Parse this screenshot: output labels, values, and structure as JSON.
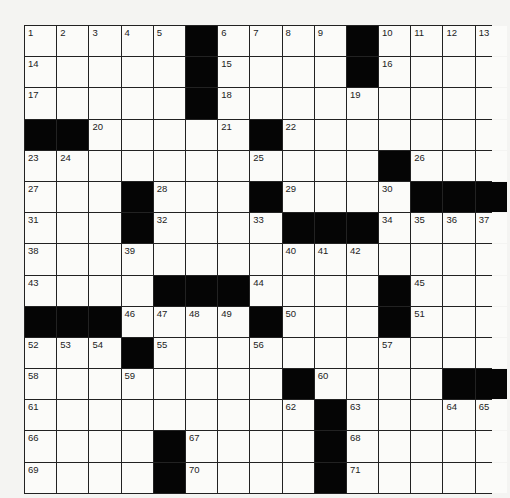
{
  "puzzle": {
    "rows": 15,
    "cols": 15,
    "colors": {
      "black": "#050505",
      "white": "#fbfbf9",
      "grid_line": "#222222"
    },
    "black_cells": [
      [
        0,
        5
      ],
      [
        0,
        10
      ],
      [
        1,
        5
      ],
      [
        1,
        10
      ],
      [
        2,
        5
      ],
      [
        3,
        0
      ],
      [
        3,
        1
      ],
      [
        3,
        7
      ],
      [
        4,
        11
      ],
      [
        5,
        3
      ],
      [
        5,
        7
      ],
      [
        5,
        12
      ],
      [
        5,
        13
      ],
      [
        5,
        14
      ],
      [
        6,
        3
      ],
      [
        6,
        8
      ],
      [
        6,
        9
      ],
      [
        6,
        10
      ],
      [
        8,
        4
      ],
      [
        8,
        5
      ],
      [
        8,
        6
      ],
      [
        8,
        11
      ],
      [
        9,
        0
      ],
      [
        9,
        1
      ],
      [
        9,
        2
      ],
      [
        9,
        7
      ],
      [
        9,
        11
      ],
      [
        10,
        3
      ],
      [
        11,
        8
      ],
      [
        11,
        13
      ],
      [
        11,
        14
      ],
      [
        12,
        9
      ],
      [
        13,
        4
      ],
      [
        13,
        9
      ],
      [
        14,
        4
      ],
      [
        14,
        9
      ]
    ],
    "numbers": [
      {
        "r": 0,
        "c": 0,
        "n": "1"
      },
      {
        "r": 0,
        "c": 1,
        "n": "2"
      },
      {
        "r": 0,
        "c": 2,
        "n": "3"
      },
      {
        "r": 0,
        "c": 3,
        "n": "4"
      },
      {
        "r": 0,
        "c": 4,
        "n": "5"
      },
      {
        "r": 0,
        "c": 6,
        "n": "6"
      },
      {
        "r": 0,
        "c": 7,
        "n": "7"
      },
      {
        "r": 0,
        "c": 8,
        "n": "8"
      },
      {
        "r": 0,
        "c": 9,
        "n": "9"
      },
      {
        "r": 0,
        "c": 11,
        "n": "10"
      },
      {
        "r": 0,
        "c": 12,
        "n": "11"
      },
      {
        "r": 0,
        "c": 13,
        "n": "12"
      },
      {
        "r": 0,
        "c": 14,
        "n": "13"
      },
      {
        "r": 1,
        "c": 0,
        "n": "14"
      },
      {
        "r": 1,
        "c": 6,
        "n": "15"
      },
      {
        "r": 1,
        "c": 11,
        "n": "16"
      },
      {
        "r": 2,
        "c": 0,
        "n": "17"
      },
      {
        "r": 2,
        "c": 6,
        "n": "18"
      },
      {
        "r": 2,
        "c": 10,
        "n": "19"
      },
      {
        "r": 3,
        "c": 2,
        "n": "20"
      },
      {
        "r": 3,
        "c": 6,
        "n": "21"
      },
      {
        "r": 3,
        "c": 8,
        "n": "22"
      },
      {
        "r": 4,
        "c": 0,
        "n": "23"
      },
      {
        "r": 4,
        "c": 1,
        "n": "24"
      },
      {
        "r": 4,
        "c": 7,
        "n": "25"
      },
      {
        "r": 4,
        "c": 12,
        "n": "26"
      },
      {
        "r": 5,
        "c": 0,
        "n": "27"
      },
      {
        "r": 5,
        "c": 4,
        "n": "28"
      },
      {
        "r": 5,
        "c": 8,
        "n": "29"
      },
      {
        "r": 5,
        "c": 11,
        "n": "30"
      },
      {
        "r": 6,
        "c": 0,
        "n": "31"
      },
      {
        "r": 6,
        "c": 4,
        "n": "32"
      },
      {
        "r": 6,
        "c": 7,
        "n": "33"
      },
      {
        "r": 6,
        "c": 11,
        "n": "34"
      },
      {
        "r": 6,
        "c": 12,
        "n": "35"
      },
      {
        "r": 6,
        "c": 13,
        "n": "36"
      },
      {
        "r": 6,
        "c": 14,
        "n": "37"
      },
      {
        "r": 7,
        "c": 0,
        "n": "38"
      },
      {
        "r": 7,
        "c": 3,
        "n": "39"
      },
      {
        "r": 7,
        "c": 8,
        "n": "40"
      },
      {
        "r": 7,
        "c": 9,
        "n": "41"
      },
      {
        "r": 7,
        "c": 10,
        "n": "42"
      },
      {
        "r": 8,
        "c": 0,
        "n": "43"
      },
      {
        "r": 8,
        "c": 7,
        "n": "44"
      },
      {
        "r": 8,
        "c": 12,
        "n": "45"
      },
      {
        "r": 9,
        "c": 3,
        "n": "46"
      },
      {
        "r": 9,
        "c": 4,
        "n": "47"
      },
      {
        "r": 9,
        "c": 5,
        "n": "48"
      },
      {
        "r": 9,
        "c": 6,
        "n": "49"
      },
      {
        "r": 9,
        "c": 8,
        "n": "50"
      },
      {
        "r": 9,
        "c": 12,
        "n": "51"
      },
      {
        "r": 10,
        "c": 0,
        "n": "52"
      },
      {
        "r": 10,
        "c": 1,
        "n": "53"
      },
      {
        "r": 10,
        "c": 2,
        "n": "54"
      },
      {
        "r": 10,
        "c": 4,
        "n": "55"
      },
      {
        "r": 10,
        "c": 7,
        "n": "56"
      },
      {
        "r": 10,
        "c": 11,
        "n": "57"
      },
      {
        "r": 11,
        "c": 0,
        "n": "58"
      },
      {
        "r": 11,
        "c": 3,
        "n": "59"
      },
      {
        "r": 11,
        "c": 9,
        "n": "60"
      },
      {
        "r": 12,
        "c": 0,
        "n": "61"
      },
      {
        "r": 12,
        "c": 8,
        "n": "62"
      },
      {
        "r": 12,
        "c": 10,
        "n": "63"
      },
      {
        "r": 12,
        "c": 13,
        "n": "64"
      },
      {
        "r": 12,
        "c": 14,
        "n": "65"
      },
      {
        "r": 13,
        "c": 0,
        "n": "66"
      },
      {
        "r": 13,
        "c": 5,
        "n": "67"
      },
      {
        "r": 13,
        "c": 10,
        "n": "68"
      },
      {
        "r": 14,
        "c": 0,
        "n": "69"
      },
      {
        "r": 14,
        "c": 5,
        "n": "70"
      },
      {
        "r": 14,
        "c": 10,
        "n": "71"
      }
    ]
  },
  "footer": {
    "text": ""
  }
}
